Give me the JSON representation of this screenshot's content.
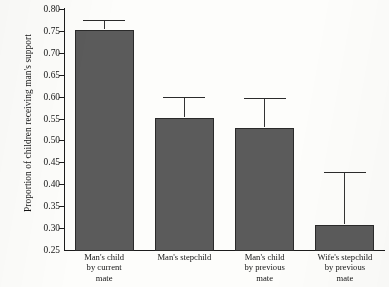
{
  "chart_data": {
    "type": "bar",
    "title": "",
    "xlabel": "",
    "ylabel": "Proportion of children receiving man's support",
    "categories": [
      "Man's child by current mate",
      "Man's stepchild",
      "Man's child by previous mate",
      "Wife's stepchild by previous mate"
    ],
    "category_lines": [
      [
        "Man's child",
        "by current",
        "mate"
      ],
      [
        "Man's stepchild"
      ],
      [
        "Man's child",
        "by previous",
        "mate"
      ],
      [
        "Wife's stepchild",
        "by previous",
        "mate"
      ]
    ],
    "values": [
      0.755,
      0.554,
      0.531,
      0.309
    ],
    "error_upper": [
      0.775,
      0.6,
      0.598,
      0.428
    ],
    "error_bars": [
      0.02,
      0.046,
      0.067,
      0.119
    ],
    "ylim": [
      0.25,
      0.8
    ],
    "ytick_values": [
      0.8,
      0.75,
      0.7,
      0.65,
      0.6,
      0.55,
      0.5,
      0.45,
      0.4,
      0.35,
      0.3,
      0.25
    ],
    "ytick_labels": [
      "0.80",
      "0.75",
      "0.70",
      "0.65",
      "0.60",
      "0.55",
      "0.50",
      "0.45",
      "0.40",
      "0.35",
      "0.30",
      "0.25"
    ],
    "grid": false,
    "legend": null,
    "bar_color": "#5b5b5b",
    "axis_color": "#1c1c1c",
    "background_color": "#fdfdfb"
  }
}
